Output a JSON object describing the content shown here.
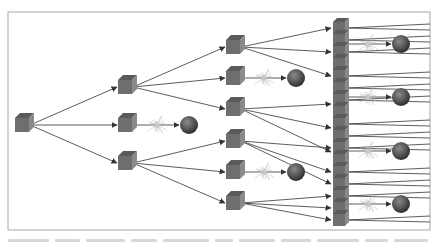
{
  "diagram": {
    "type": "branching-tree",
    "colors": {
      "frame": "#a8a8a8",
      "background": "#ffffff",
      "cube_front": "#6e6e6e",
      "cube_top": "#5a5a5a",
      "cube_side": "#8a8a8a",
      "arrow": "#333333",
      "burst": "#b8b8b8",
      "sphere": "#555555"
    },
    "frame": {
      "x": 8,
      "y": 12,
      "w": 422,
      "h": 218
    },
    "nodes": [
      {
        "id": "root",
        "kind": "cube",
        "x": 22,
        "y": 125,
        "size": 14
      },
      {
        "id": "c1a",
        "kind": "cube",
        "x": 125,
        "y": 87,
        "size": 14
      },
      {
        "id": "c1b",
        "kind": "cube",
        "x": 125,
        "y": 125,
        "size": 14
      },
      {
        "id": "c1c",
        "kind": "cube",
        "x": 125,
        "y": 163,
        "size": 14
      },
      {
        "id": "s1b",
        "kind": "sphere",
        "x": 189,
        "y": 125,
        "r": 9
      },
      {
        "id": "c2a",
        "kind": "cube",
        "x": 233,
        "y": 47,
        "size": 14
      },
      {
        "id": "c2b",
        "kind": "cube",
        "x": 233,
        "y": 78,
        "size": 14
      },
      {
        "id": "c2c",
        "kind": "cube",
        "x": 233,
        "y": 109,
        "size": 14
      },
      {
        "id": "c2d",
        "kind": "cube",
        "x": 233,
        "y": 141,
        "size": 14
      },
      {
        "id": "c2e",
        "kind": "cube",
        "x": 233,
        "y": 172,
        "size": 14
      },
      {
        "id": "c2f",
        "kind": "cube",
        "x": 233,
        "y": 203,
        "size": 14
      },
      {
        "id": "s2b",
        "kind": "sphere",
        "x": 296,
        "y": 78,
        "r": 9
      },
      {
        "id": "s2e",
        "kind": "sphere",
        "x": 296,
        "y": 172,
        "r": 9
      }
    ],
    "stack": {
      "x": 339,
      "y_top": 22,
      "count": 17,
      "pitch": 12,
      "size": 12
    },
    "terminal_spheres": [
      {
        "x": 401,
        "y": 44,
        "r": 9
      },
      {
        "x": 401,
        "y": 97,
        "r": 9
      },
      {
        "x": 401,
        "y": 151,
        "r": 9
      },
      {
        "x": 401,
        "y": 204,
        "r": 9
      }
    ],
    "caption_visible": false
  }
}
